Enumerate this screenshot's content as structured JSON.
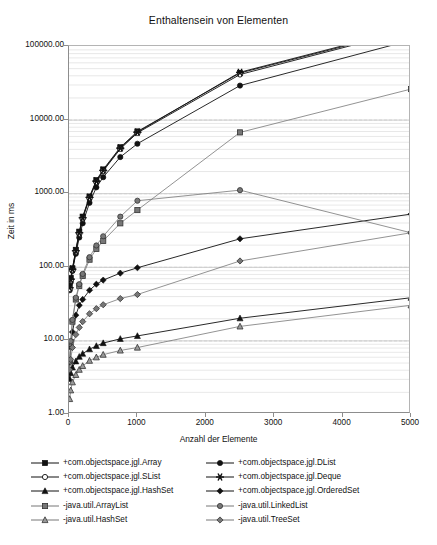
{
  "chart_data": {
    "type": "line",
    "title": "Enthaltensein von Elementen",
    "xlabel": "Anzahl der Elemente",
    "ylabel": "Zeit in ms",
    "xscale": "linear",
    "yscale": "log",
    "xlim": [
      0,
      5000
    ],
    "ylim": [
      1.0,
      100000.0
    ],
    "xticks": [
      0,
      1000,
      2000,
      3000,
      4000,
      5000
    ],
    "xticklabels": [
      "0",
      "1000",
      "2000",
      "3000",
      "4000",
      "5000"
    ],
    "yticks": [
      1.0,
      10.0,
      100.0,
      1000.0,
      10000.0,
      100000.0
    ],
    "yticklabels": [
      "1.00",
      "10.00",
      "100.00",
      "1000.00",
      "10000.00",
      "100000.00"
    ],
    "grid": "horizontal-minor-log",
    "legend_position": "below-axes",
    "legend_columns": 2,
    "x": [
      10,
      25,
      50,
      100,
      150,
      200,
      300,
      400,
      500,
      750,
      1000,
      2500,
      5000
    ],
    "series": [
      {
        "name": "+com.objectspace.jgl.Array",
        "marker": "filled-square",
        "color": "#111111",
        "values": [
          55,
          70,
          95,
          170,
          300,
          480,
          900,
          1500,
          2100,
          4200,
          6900,
          43000,
          170000
        ]
      },
      {
        "name": "+com.objectspace.jgl.DList",
        "marker": "filled-circle",
        "color": "#111111",
        "values": [
          48,
          62,
          88,
          150,
          250,
          390,
          740,
          1200,
          1650,
          3100,
          4700,
          29000,
          120000
        ]
      },
      {
        "name": "+com.objectspace.jgl.SList",
        "marker": "open-circle",
        "color": "#111111",
        "values": [
          50,
          65,
          90,
          160,
          280,
          450,
          860,
          1420,
          2000,
          4000,
          6600,
          41000,
          165000
        ]
      },
      {
        "name": "+com.objectspace.jgl.Deque",
        "marker": "asterisk",
        "color": "#111111",
        "values": [
          52,
          68,
          93,
          165,
          290,
          465,
          880,
          1460,
          2050,
          4100,
          6750,
          44000,
          175000
        ]
      },
      {
        "name": "+com.objectspace.jgl.HashSet",
        "marker": "filled-triangle",
        "color": "#111111",
        "values": [
          3.0,
          3.6,
          4.3,
          5.2,
          6.0,
          6.6,
          7.6,
          8.4,
          9.2,
          10.5,
          11.5,
          20.0,
          38.0
        ]
      },
      {
        "name": "+com.objectspace.jgl.OrderedSet",
        "marker": "filled-diamond",
        "color": "#111111",
        "values": [
          5.0,
          8.0,
          13.0,
          22.0,
          30.0,
          36.0,
          48.0,
          58.0,
          66.0,
          82.0,
          97.0,
          240.0,
          520.0
        ]
      },
      {
        "name": "-java.util.ArrayList",
        "marker": "gray-square",
        "color": "#777777",
        "values": [
          5.2,
          9.5,
          18.0,
          36.0,
          55.0,
          75.0,
          125.0,
          175.0,
          225.0,
          390.0,
          590.0,
          6700.0,
          26000.0
        ]
      },
      {
        "name": "-java.util.LinkedList",
        "marker": "gray-circle",
        "color": "#777777",
        "values": [
          5.2,
          9.8,
          19.0,
          38.0,
          58.0,
          80.0,
          135.0,
          195.0,
          260.0,
          480.0,
          790.0,
          1100.0,
          290.0
        ]
      },
      {
        "name": "-java.util.HashSet",
        "marker": "gray-triangle",
        "color": "#777777",
        "values": [
          1.6,
          2.1,
          2.7,
          3.4,
          4.0,
          4.5,
          5.3,
          5.9,
          6.4,
          7.3,
          8.0,
          15.5,
          30.0
        ]
      },
      {
        "name": "-java.util.TreeSet",
        "marker": "gray-diamond",
        "color": "#777777",
        "values": [
          4.0,
          5.5,
          8.0,
          12.0,
          15.0,
          18.0,
          23.0,
          27.0,
          30.5,
          37.0,
          42.0,
          120.0,
          290.0
        ]
      }
    ]
  },
  "legend": {
    "items": [
      {
        "label": "+com.objectspace.jgl.Array",
        "marker": "filled-square",
        "column": 0
      },
      {
        "label": "+com.objectspace.jgl.SList",
        "marker": "open-circle",
        "column": 0
      },
      {
        "label": "+com.objectspace.jgl.HashSet",
        "marker": "filled-triangle",
        "column": 0
      },
      {
        "label": "-java.util.ArrayList",
        "marker": "gray-square",
        "column": 0
      },
      {
        "label": "-java.util.HashSet",
        "marker": "gray-triangle",
        "column": 0
      },
      {
        "label": "+com.objectspace.jgl.DList",
        "marker": "filled-circle",
        "column": 1
      },
      {
        "label": "+com.objectspace.jgl.Deque",
        "marker": "asterisk",
        "column": 1
      },
      {
        "label": "+com.objectspace.jgl.OrderedSet",
        "marker": "filled-diamond",
        "column": 1
      },
      {
        "label": "-java.util.LinkedList",
        "marker": "gray-circle",
        "column": 1
      },
      {
        "label": "-java.util.TreeSet",
        "marker": "gray-diamond",
        "column": 1
      }
    ]
  },
  "colors": {
    "line_dark": "#111111",
    "line_gray": "#777777",
    "grid_minor": "#d9d9d9",
    "grid_major": "#c4c4c4",
    "axis": "#8d8d8d",
    "background": "#ffffff"
  }
}
